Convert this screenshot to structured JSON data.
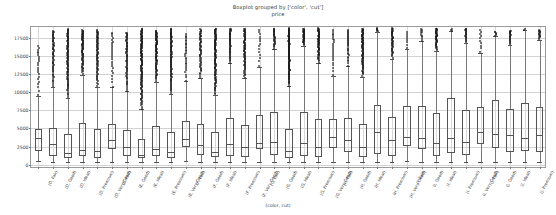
{
  "title": "Boxplot grouped by ['color', 'cut']",
  "subtitle": "price",
  "xaxis_title": "(color, cut)",
  "chart_data": {
    "type": "bar",
    "chart_kind": "boxplot",
    "title": "Boxplot grouped by ['color', 'cut']",
    "subtitle": "price",
    "xlabel": "(color, cut)",
    "ylabel": "price",
    "ylim": [
      -600,
      19000
    ],
    "yticks": [
      0,
      2500,
      5000,
      7500,
      10000,
      12500,
      15000,
      17500
    ],
    "ytick_labels": [
      "0",
      "2500",
      "5000",
      "7500",
      "10000",
      "12500",
      "15000",
      "17500"
    ],
    "grid": true,
    "legend": "none",
    "grouping": [
      "color",
      "cut"
    ],
    "colors": [
      "D",
      "E",
      "F",
      "G",
      "H",
      "I",
      "J"
    ],
    "cuts": [
      "Fair",
      "Good",
      "Ideal",
      "Premium",
      "Very Good"
    ],
    "categories": [
      "(D, Fair)",
      "(D, Good)",
      "(D, Ideal)",
      "(D, Premium)",
      "(D, Very Good)",
      "(E, Fair)",
      "(E, Good)",
      "(E, Ideal)",
      "(E, Premium)",
      "(E, Very Good)",
      "(F, Fair)",
      "(F, Good)",
      "(F, Ideal)",
      "(F, Premium)",
      "(F, Very Good)",
      "(G, Fair)",
      "(G, Good)",
      "(G, Ideal)",
      "(G, Premium)",
      "(G, Very Good)",
      "(H, Fair)",
      "(H, Good)",
      "(H, Ideal)",
      "(H, Premium)",
      "(H, Very Good)",
      "(I, Fair)",
      "(I, Good)",
      "(I, Ideal)",
      "(I, Premium)",
      "(I, Very Good)",
      "(J, Fair)",
      "(J, Good)",
      "(J, Ideal)",
      "(J, Premium)",
      "(J, Very Good)"
    ],
    "boxes": [
      {
        "category": "(D, Fair)",
        "whisker_low": 536,
        "q1": 1884,
        "median": 3730,
        "q3": 4960,
        "whisker_high": 9470,
        "flier_count": 22,
        "flier_min": 9600,
        "flier_max": 16386
      },
      {
        "category": "(D, Good)",
        "whisker_low": 361,
        "q1": 1145,
        "median": 2854,
        "q3": 5002,
        "whisker_high": 10700,
        "flier_count": 60,
        "flier_min": 10800,
        "flier_max": 18468
      },
      {
        "category": "(D, Ideal)",
        "whisker_low": 367,
        "q1": 878,
        "median": 1576,
        "q3": 4214,
        "whisker_high": 9200,
        "flier_count": 95,
        "flier_min": 9300,
        "flier_max": 18693
      },
      {
        "category": "(D, Premium)",
        "whisker_low": 367,
        "q1": 1214,
        "median": 2009,
        "q3": 5697,
        "whisker_high": 12400,
        "flier_count": 70,
        "flier_min": 12500,
        "flier_max": 18575
      },
      {
        "category": "(D, Very Good)",
        "whisker_low": 357,
        "q1": 911,
        "median": 1838,
        "q3": 4868,
        "whisker_high": 10750,
        "flier_count": 72,
        "flier_min": 10850,
        "flier_max": 18542
      },
      {
        "category": "(E, Fair)",
        "whisker_low": 337,
        "q1": 2111,
        "median": 3417,
        "q3": 5584,
        "whisker_high": 10650,
        "flier_count": 25,
        "flier_min": 10750,
        "flier_max": 18236
      },
      {
        "category": "(E, Good)",
        "whisker_low": 327,
        "q1": 1145,
        "median": 2420,
        "q3": 4756,
        "whisker_high": 10100,
        "flier_count": 66,
        "flier_min": 10200,
        "flier_max": 18236
      },
      {
        "category": "(E, Ideal)",
        "whisker_low": 326,
        "q1": 882,
        "median": 1370,
        "q3": 3607,
        "whisker_high": 7650,
        "flier_count": 130,
        "flier_min": 7750,
        "flier_max": 18729
      },
      {
        "category": "(E, Premium)",
        "whisker_low": 326,
        "q1": 1158,
        "median": 2127,
        "q3": 5299,
        "whisker_high": 11450,
        "flier_count": 85,
        "flier_min": 11550,
        "flier_max": 18477
      },
      {
        "category": "(E, Very Good)",
        "whisker_low": 354,
        "q1": 882,
        "median": 1806,
        "q3": 4484,
        "whisker_high": 9800,
        "flier_count": 98,
        "flier_min": 9900,
        "flier_max": 18731
      },
      {
        "category": "(F, Fair)",
        "whisker_low": 496,
        "q1": 2417,
        "median": 3494,
        "q3": 6068,
        "whisker_high": 11500,
        "flier_count": 28,
        "flier_min": 11600,
        "flier_max": 17995
      },
      {
        "category": "(F, Good)",
        "whisker_low": 357,
        "q1": 1311,
        "median": 2647,
        "q3": 5567,
        "whisker_high": 11900,
        "flier_count": 55,
        "flier_min": 12000,
        "flier_max": 18686
      },
      {
        "category": "(F, Ideal)",
        "whisker_low": 408,
        "q1": 1000,
        "median": 1775,
        "q3": 4466,
        "whisker_high": 9600,
        "flier_count": 110,
        "flier_min": 9700,
        "flier_max": 18780
      },
      {
        "category": "(F, Premium)",
        "whisker_low": 342,
        "q1": 1226,
        "median": 2835,
        "q3": 6381,
        "whisker_high": 14000,
        "flier_count": 48,
        "flier_min": 14100,
        "flier_max": 18791
      },
      {
        "category": "(F, Very Good)",
        "whisker_low": 357,
        "q1": 1071,
        "median": 2471,
        "q3": 5434,
        "whisker_high": 11900,
        "flier_count": 72,
        "flier_min": 12000,
        "flier_max": 18777
      },
      {
        "category": "(G, Fair)",
        "whisker_low": 361,
        "q1": 2167,
        "median": 3057,
        "q3": 6791,
        "whisker_high": 13500,
        "flier_count": 14,
        "flier_min": 13600,
        "flier_max": 18574
      },
      {
        "category": "(G, Good)",
        "whisker_low": 394,
        "q1": 1378,
        "median": 3117,
        "q3": 7240,
        "whisker_high": 15900,
        "flier_count": 30,
        "flier_min": 16000,
        "flier_max": 18788
      },
      {
        "category": "(G, Ideal)",
        "whisker_low": 361,
        "q1": 884,
        "median": 1857,
        "q3": 4884,
        "whisker_high": 10800,
        "flier_count": 120,
        "flier_min": 10900,
        "flier_max": 18806
      },
      {
        "category": "(G, Premium)",
        "whisker_low": 382,
        "q1": 1216,
        "median": 2951,
        "q3": 7314,
        "whisker_high": 16400,
        "flier_count": 38,
        "flier_min": 16500,
        "flier_max": 18741
      },
      {
        "category": "(G, Very Good)",
        "whisker_low": 354,
        "q1": 1045,
        "median": 2437,
        "q3": 6290,
        "whisker_high": 14000,
        "flier_count": 62,
        "flier_min": 14100,
        "flier_max": 18818
      },
      {
        "category": "(H, Fair)",
        "whisker_low": 368,
        "q1": 2352,
        "median": 3816,
        "q3": 6342,
        "whisker_high": 12300,
        "flier_count": 22,
        "flier_min": 12400,
        "flier_max": 18565
      },
      {
        "category": "(H, Good)",
        "whisker_low": 368,
        "q1": 1774,
        "median": 3468,
        "q3": 6504,
        "whisker_high": 13550,
        "flier_count": 30,
        "flier_min": 13650,
        "flier_max": 18640
      },
      {
        "category": "(H, Ideal)",
        "whisker_low": 357,
        "q1": 1105,
        "median": 2493,
        "q3": 5549,
        "whisker_high": 12150,
        "flier_count": 85,
        "flier_min": 12250,
        "flier_max": 18760
      },
      {
        "category": "(H, Premium)",
        "whisker_low": 368,
        "q1": 1491,
        "median": 4511,
        "q3": 8243,
        "whisker_high": 18300,
        "flier_count": 6,
        "flier_min": 18400,
        "flier_max": 18795
      },
      {
        "category": "(H, Very Good)",
        "whisker_low": 337,
        "q1": 1226,
        "median": 3340,
        "q3": 6603,
        "whisker_high": 14650,
        "flier_count": 45,
        "flier_min": 14750,
        "flier_max": 18803
      },
      {
        "category": "(I, Fair)",
        "whisker_low": 460,
        "q1": 2642,
        "median": 3780,
        "q3": 8064,
        "whisker_high": 16000,
        "flier_count": 8,
        "flier_min": 16100,
        "flier_max": 18242
      },
      {
        "category": "(I, Good)",
        "whisker_low": 351,
        "q1": 2146,
        "median": 3639,
        "q3": 8087,
        "whisker_high": 17000,
        "flier_count": 10,
        "flier_min": 17100,
        "flier_max": 18707
      },
      {
        "category": "(I, Ideal)",
        "whisker_low": 348,
        "q1": 1257,
        "median": 3002,
        "q3": 7068,
        "whisker_high": 15700,
        "flier_count": 42,
        "flier_min": 15800,
        "flier_max": 18779
      },
      {
        "category": "(I, Premium)",
        "whisker_low": 334,
        "q1": 1675,
        "median": 3719,
        "q3": 9177,
        "whisker_high": 18450,
        "flier_count": 3,
        "flier_min": 18500,
        "flier_max": 18760
      },
      {
        "category": "(I, Very Good)",
        "whisker_low": 336,
        "q1": 1370,
        "median": 3151,
        "q3": 7568,
        "whisker_high": 16800,
        "flier_count": 20,
        "flier_min": 16900,
        "flier_max": 18787
      },
      {
        "category": "(J, Fair)",
        "whisker_low": 416,
        "q1": 2804,
        "median": 4439,
        "q3": 7900,
        "whisker_high": 15400,
        "flier_count": 10,
        "flier_min": 15500,
        "flier_max": 18531
      },
      {
        "category": "(J, Good)",
        "whisker_low": 335,
        "q1": 2333,
        "median": 4258,
        "q3": 8950,
        "whisker_high": 17700,
        "flier_count": 6,
        "flier_min": 17800,
        "flier_max": 18325
      },
      {
        "category": "(J, Ideal)",
        "whisker_low": 340,
        "q1": 1765,
        "median": 4096,
        "q3": 7695,
        "whisker_high": 16500,
        "flier_count": 20,
        "flier_min": 16600,
        "flier_max": 18508
      },
      {
        "category": "(J, Premium)",
        "whisker_low": 363,
        "q1": 1860,
        "median": 3697,
        "q3": 8537,
        "whisker_high": 18600,
        "flier_count": 2,
        "flier_min": 18650,
        "flier_max": 18710
      },
      {
        "category": "(J, Very Good)",
        "whisker_low": 336,
        "q1": 1810,
        "median": 4113,
        "q3": 7992,
        "whisker_high": 17200,
        "flier_count": 14,
        "flier_min": 17300,
        "flier_max": 18565
      }
    ]
  }
}
